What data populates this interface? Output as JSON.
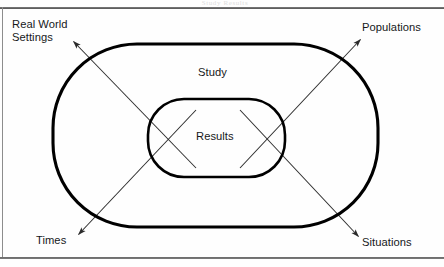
{
  "figure": {
    "header_fragment": "Study Results",
    "inner_region_label": "Results",
    "outer_region_label": "Study",
    "corner_labels": {
      "top_left": "Real World\nSettings",
      "top_right": "Populations",
      "bottom_left": "Times",
      "bottom_right": "Situations"
    },
    "colors": {
      "ink": "#16181a",
      "shape_stroke": "#000000",
      "arrow_stroke": "#2b2b2b",
      "rule": "#4a4a4a",
      "background": "#fefefe"
    },
    "geometry": {
      "outer_shape": {
        "type": "stadium",
        "x": 53,
        "y": 44,
        "width": 325,
        "height": 183,
        "stroke_width": 3.1
      },
      "inner_shape": {
        "type": "stadium",
        "x": 148,
        "y": 99,
        "width": 137,
        "height": 78,
        "stroke_width": 2.6
      },
      "arrows": [
        {
          "name": "arrow-to-real-world-settings",
          "x1": 196,
          "y1": 168,
          "x2": 72,
          "y2": 40
        },
        {
          "name": "arrow-to-populations",
          "x1": 240,
          "y1": 168,
          "x2": 362,
          "y2": 38
        },
        {
          "name": "arrow-to-times",
          "x1": 196,
          "y1": 110,
          "x2": 77,
          "y2": 236
        },
        {
          "name": "arrow-to-situations",
          "x1": 240,
          "y1": 110,
          "x2": 360,
          "y2": 238
        }
      ]
    }
  }
}
